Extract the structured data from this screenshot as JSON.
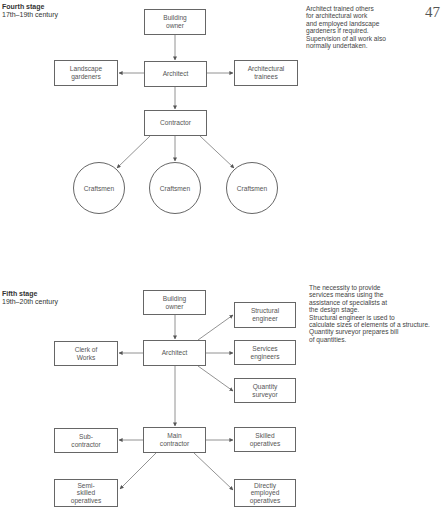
{
  "page_number": "47",
  "fourth_stage": {
    "title": "Fourth stage",
    "period": "17th–19th century",
    "note": "Architect trained others\nfor architectural work\nand employed landscape\ngardeners if required.\nSupervision of all work also\nnormally undertaken.",
    "nodes": {
      "building_owner": "Building\nowner",
      "architect": "Architect",
      "landscape_gardeners": "Landscape\ngardeners",
      "architectural_trainees": "Architectural\ntrainees",
      "contractor": "Contractor",
      "craftsmen": [
        "Craftsmen",
        "Craftsmen",
        "Craftsmen"
      ]
    }
  },
  "fifth_stage": {
    "title": "Fifth stage",
    "period": "19th–20th century",
    "note": "The necessity to provide\nservices means using the\nassistance of specialists at\nthe design stage.\nStructural engineer is used to\ncalculate sizes of elements of a structure.\nQuantity surveyor prepares bill\nof quantities.",
    "nodes": {
      "building_owner": "Building\nowner",
      "architect": "Architect",
      "clerk_of_works": "Clerk of\nWorks",
      "structural_engineer": "Structural\nengineer",
      "services_engineers": "Services\nengineers",
      "quantity_surveyor": "Quantity\nsurveyor",
      "main_contractor": "Main\ncontractor",
      "sub_contractor": "Sub-\ncontractor",
      "skilled_operatives": "Skilled\noperatives",
      "semi_skilled_operatives": "Semi-\nskilled\noperatives",
      "directly_employed_operatives": "Directly\nemployed\noperatives"
    }
  }
}
